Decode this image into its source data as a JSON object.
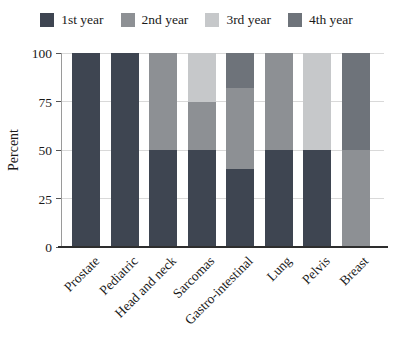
{
  "figure": {
    "background": "#ffffff",
    "axis_color": "#2e2e2e",
    "gridline_color": "#d9d9d9"
  },
  "chart_data": {
    "type": "bar",
    "stacked": true,
    "title": "",
    "xlabel": "",
    "ylabel": "Percent",
    "ylim": [
      0,
      100
    ],
    "yticks": [
      "0",
      "25",
      "50",
      "75",
      "100"
    ],
    "ytick_values": [
      0,
      25,
      50,
      75,
      100
    ],
    "grid": true,
    "legend_position": "top",
    "categories": [
      "Prostate",
      "Pediatric",
      "Head and neck",
      "Sarcomas",
      "Gastro-intestinal",
      "Lung",
      "Pelvis",
      "Breast"
    ],
    "series": [
      {
        "name": "1st year",
        "color": "#3e4551",
        "values": [
          100,
          100,
          50,
          50,
          40,
          50,
          50,
          0
        ]
      },
      {
        "name": "2nd year",
        "color": "#8d9094",
        "values": [
          0,
          0,
          50,
          25,
          42,
          50,
          0,
          50
        ]
      },
      {
        "name": "3rd year",
        "color": "#c6c8ca",
        "values": [
          0,
          0,
          0,
          25,
          0,
          0,
          50,
          0
        ]
      },
      {
        "name": "4th year",
        "color": "#6e737a",
        "values": [
          0,
          0,
          0,
          0,
          18,
          0,
          0,
          50
        ]
      }
    ]
  }
}
